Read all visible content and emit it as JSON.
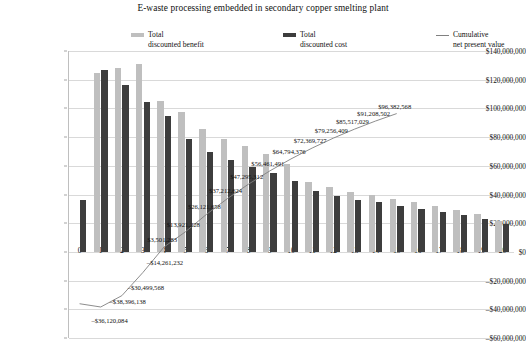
{
  "chart_data": {
    "type": "bar",
    "title": "E-waste processing embedded in secondary copper smelting plant",
    "xlabel": "",
    "ylabel": "",
    "ylim": [
      -60000000,
      140000000
    ],
    "ytick_values": [
      140000000,
      120000000,
      100000000,
      80000000,
      60000000,
      40000000,
      20000000,
      0,
      -20000000,
      -40000000,
      -60000000
    ],
    "ytick_labels": [
      "$140,000,000",
      "$120,000,000",
      "$100,000,000",
      "$80,000,000",
      "$60,000,000",
      "$40,000,000",
      "$20,000,000",
      "$0",
      "–$20,000,000",
      "–$40,000,000",
      "–$60,000,000"
    ],
    "grid": true,
    "legend_position": "top",
    "categories": [
      "0",
      "1",
      "2",
      "3",
      "4",
      "5",
      "6",
      "7",
      "8",
      "9",
      "10",
      "11",
      "12",
      "13",
      "14",
      "15",
      "16",
      "17",
      "18",
      "19",
      "20"
    ],
    "series": [
      {
        "name": "Total discounted benefit",
        "type": "bar",
        "color": "#bfbfbf",
        "values": [
          0,
          124500000,
          128500000,
          131000000,
          105500000,
          97500000,
          85500000,
          79000000,
          73500000,
          68500000,
          61000000,
          48500000,
          45000000,
          42000000,
          39500000,
          37000000,
          34500000,
          32000000,
          29500000,
          26500000,
          21500000
        ]
      },
      {
        "name": "Total discounted cost",
        "type": "bar",
        "color": "#3d3d3d",
        "values": [
          36120084,
          126500000,
          116000000,
          104500000,
          94500000,
          78500000,
          69500000,
          64000000,
          59500000,
          55000000,
          49500000,
          42500000,
          39000000,
          36500000,
          34500000,
          32000000,
          30000000,
          27500000,
          25500000,
          23000000,
          19500000
        ]
      },
      {
        "name": "Cumulative net present value",
        "type": "line",
        "color": "#808080",
        "values": [
          -36120084,
          -38396138,
          -30499568,
          -14261232,
          3501283,
          13921228,
          26121658,
          37212624,
          47295312,
          56461491,
          64794376,
          72369727,
          79256409,
          85517029,
          91208502,
          96382568,
          null,
          null,
          null,
          null,
          null
        ],
        "labels": [
          {
            "x": 0,
            "value": -36120084,
            "text": "–$36,120,084"
          },
          {
            "x": 1,
            "value": -38396138,
            "text": "–$38,396,138"
          },
          {
            "x": 2,
            "value": -30499568,
            "text": "–$30,499,568"
          },
          {
            "x": 3,
            "value": -14261232,
            "text": "–$14,261,232"
          },
          {
            "x": 4,
            "value": 3501283,
            "text": "$3,501,283"
          },
          {
            "x": 5,
            "value": 13921228,
            "text": "$13,921,228"
          },
          {
            "x": 6,
            "value": 26121658,
            "text": "$26,121,658"
          },
          {
            "x": 7,
            "value": 37212624,
            "text": "$37,212,624"
          },
          {
            "x": 8,
            "value": 47295312,
            "text": "$47,295,312"
          },
          {
            "x": 9,
            "value": 56461491,
            "text": "$56,461,491"
          },
          {
            "x": 10,
            "value": 64794376,
            "text": "$64,794,376"
          },
          {
            "x": 11,
            "value": 72369727,
            "text": "$72,369,727"
          },
          {
            "x": 12,
            "value": 79256409,
            "text": "$79,256,409"
          },
          {
            "x": 13,
            "value": 85517029,
            "text": "$85,517,029"
          },
          {
            "x": 14,
            "value": 91208502,
            "text": "$91,208,502"
          },
          {
            "x": 15,
            "value": 96382568,
            "text": "$96,382,568"
          }
        ]
      }
    ]
  },
  "legend": {
    "benefit_label": "Total\ndiscounted benefit",
    "cost_label": "Total\ndiscounted cost",
    "npv_label": "Cumulative\nnet present value"
  }
}
